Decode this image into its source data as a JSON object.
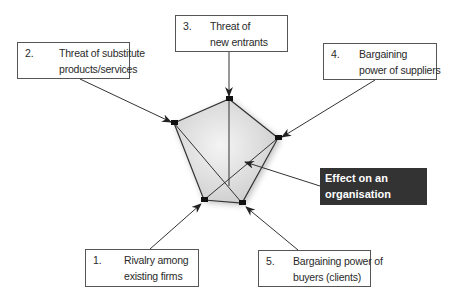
{
  "diagram": {
    "forces": [
      {
        "number": "1.",
        "line1": "Rivalry among",
        "line2": "existing firms"
      },
      {
        "number": "2.",
        "line1": "Threat of substitute",
        "line2": "products/services"
      },
      {
        "number": "3.",
        "line1": "Threat of",
        "line2": "new entrants"
      },
      {
        "number": "4.",
        "line1": "Bargaining",
        "line2": "power of suppliers"
      },
      {
        "number": "5.",
        "line1": "Bargaining power of",
        "line2": "buyers (clients)"
      }
    ],
    "effect": {
      "line1": "Effect on an",
      "line2": "organisation"
    },
    "colors": {
      "box_border": "#555555",
      "effect_bg": "#333333",
      "effect_text": "#ffffff",
      "pentagon_fill": "#d9d9d9",
      "vertex_marker": "#111111",
      "arrow": "#333333"
    }
  }
}
